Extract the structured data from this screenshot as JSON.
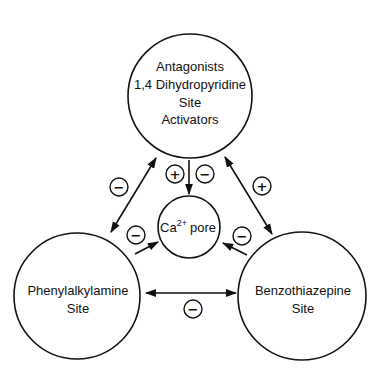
{
  "diagram": {
    "nodes": {
      "dihydropyridine": {
        "lines": [
          "Antagonists",
          "1,4 Dihydropyridine",
          "Site",
          "Activators"
        ]
      },
      "pore": {
        "ion": "Ca",
        "charge": "2+",
        "word": "pore"
      },
      "phenylalkylamine": {
        "lines": [
          "Phenylalkylamine",
          "Site"
        ]
      },
      "benzothiazepine": {
        "lines": [
          "Benzothiazepine",
          "Site"
        ]
      }
    },
    "edges": [
      {
        "from": "dihydropyridine",
        "to": "phenylalkylamine",
        "direction": "bidirectional",
        "signs": [
          "−"
        ]
      },
      {
        "from": "dihydropyridine",
        "to": "benzothiazepine",
        "direction": "bidirectional",
        "signs": [
          "+"
        ]
      },
      {
        "from": "phenylalkylamine",
        "to": "benzothiazepine",
        "direction": "bidirectional",
        "signs": [
          "−"
        ]
      },
      {
        "from": "dihydropyridine",
        "to": "pore",
        "direction": "forward",
        "signs": [
          "+",
          "−"
        ]
      },
      {
        "from": "phenylalkylamine",
        "to": "pore",
        "direction": "forward",
        "signs": [
          "−"
        ]
      },
      {
        "from": "benzothiazepine",
        "to": "pore",
        "direction": "forward",
        "signs": [
          "−"
        ]
      }
    ],
    "sign_symbols": {
      "plus": "+",
      "minus": "−"
    }
  }
}
